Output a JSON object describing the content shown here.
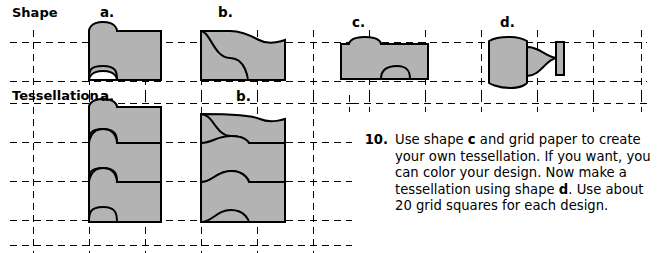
{
  "page": {
    "width": 657,
    "height": 253,
    "background": "#ffffff",
    "grid": {
      "color": "#000000",
      "dash": "7,5",
      "line_width": 1,
      "cell_width": 56,
      "cell_height": 39
    },
    "shape_fill": "#b3b3b3",
    "shape_stroke": "#000000"
  },
  "labels": {
    "shape_row": "Shape",
    "tessellation_row": "Tessellation",
    "shape_columns": [
      "a.",
      "b.",
      "c.",
      "d."
    ],
    "tessellation_columns": [
      "a.",
      "b."
    ]
  },
  "problem": {
    "number": "10.",
    "line1": "Use shape ",
    "bold1": "c",
    "line1b": " and grid paper to",
    "line2": "create your own tessellation.",
    "line3": "If you want, you can color your",
    "line4": "design. Now make a tessellation",
    "line5": "using shape ",
    "bold2": "d",
    "line5b": ". Use about 20 grid",
    "line6": "squares for each design.",
    "full_text": "Use shape c and grid paper to create your own tessellation. If you want, you can color your design. Now make a tessellation using shape d. Use about 20 grid squares for each design."
  }
}
